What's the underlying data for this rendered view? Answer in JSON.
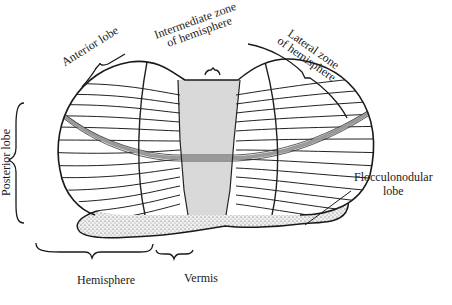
{
  "diagram": {
    "labels": {
      "anterior_lobe": "Anterior lobe",
      "intermediate_zone_line1": "Intermediate zone",
      "intermediate_zone_line2": "of hemisphere",
      "lateral_zone_line1": "Lateral zone",
      "lateral_zone_line2": "of hemisphere",
      "posterior_lobe": "Posterior lobe",
      "flocculonodular_line1": "Flocculonodular",
      "flocculonodular_line2": "lobe",
      "hemisphere": "Hemisphere",
      "vermis": "Vermis"
    },
    "colors": {
      "outline": "#1a1a1a",
      "vermis_fill": "#d9d9d9",
      "fissure": "#9a9a9a",
      "flocculus_fill": "#eeeeee"
    }
  }
}
